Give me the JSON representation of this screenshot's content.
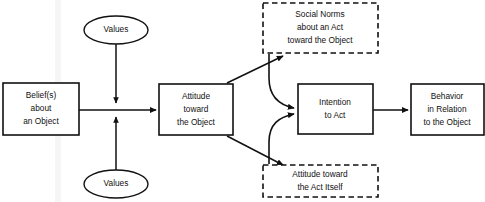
{
  "diagram": {
    "stroke_color": "#111111",
    "background_color": "#ffffff",
    "nodes": [
      {
        "id": "beliefs",
        "shape": "rect-solid",
        "lines": [
          "Belief(s)",
          "about",
          "an Object"
        ],
        "x": 3,
        "y": 83,
        "w": 76,
        "h": 52
      },
      {
        "id": "values_top",
        "shape": "ellipse",
        "lines": [
          "Values"
        ],
        "cx": 116,
        "cy": 30,
        "rx": 32,
        "ry": 14
      },
      {
        "id": "values_bottom",
        "shape": "ellipse",
        "lines": [
          "Values"
        ],
        "cx": 116,
        "cy": 184,
        "rx": 32,
        "ry": 14
      },
      {
        "id": "attitude_object",
        "shape": "rect-solid",
        "lines": [
          "Attitude",
          "toward",
          "the Object"
        ],
        "x": 159,
        "y": 84,
        "w": 74,
        "h": 51
      },
      {
        "id": "social_norms",
        "shape": "rect-dashed",
        "lines": [
          "Social Norms",
          "about an Act",
          "toward the Object"
        ],
        "x": 263,
        "y": 3,
        "w": 115,
        "h": 50
      },
      {
        "id": "attitude_act",
        "shape": "rect-dashed",
        "lines": [
          "Attitude toward",
          "the Act Itself"
        ],
        "x": 263,
        "y": 165,
        "w": 115,
        "h": 32
      },
      {
        "id": "intention",
        "shape": "rect-solid",
        "lines": [
          "Intention",
          "to Act"
        ],
        "x": 298,
        "y": 84,
        "w": 75,
        "h": 50
      },
      {
        "id": "behavior",
        "shape": "rect-solid",
        "lines": [
          "Behavior",
          "in Relation",
          "to the Object"
        ],
        "x": 411,
        "y": 84,
        "w": 73,
        "h": 51
      }
    ],
    "edges": [
      {
        "id": "beliefs-to-attitude",
        "from": "beliefs",
        "to": "attitude_object",
        "style": "straight"
      },
      {
        "id": "values-top-to-junction",
        "from": "values_top",
        "to": "beliefs-attitude-link",
        "style": "straight"
      },
      {
        "id": "values-bottom-to-junction",
        "from": "values_bottom",
        "to": "beliefs-attitude-link",
        "style": "straight"
      },
      {
        "id": "attitude-to-social-norms",
        "from": "attitude_object",
        "to": "social_norms",
        "style": "diagonal"
      },
      {
        "id": "attitude-to-attitude-act",
        "from": "attitude_object",
        "to": "attitude_act",
        "style": "diagonal"
      },
      {
        "id": "social-norms-to-intention",
        "from": "social_norms",
        "to": "intention",
        "style": "curved"
      },
      {
        "id": "attitude-act-to-intention",
        "from": "attitude_act",
        "to": "intention",
        "style": "curved"
      },
      {
        "id": "intention-to-behavior",
        "from": "intention",
        "to": "behavior",
        "style": "straight"
      }
    ]
  }
}
